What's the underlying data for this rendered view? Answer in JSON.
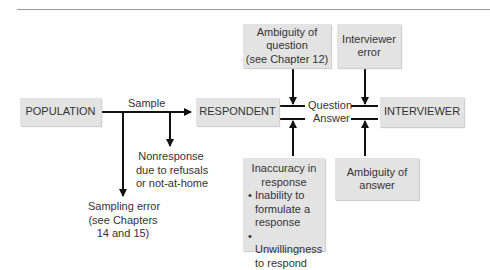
{
  "diagram": {
    "nodes": {
      "population": "POPULATION",
      "respondent": "RESPONDENT",
      "interviewer": "INTERVIEWER",
      "ambiguity_question": [
        "Ambiguity of",
        "question",
        "(see Chapter 12)"
      ],
      "interviewer_error": [
        "Interviewer",
        "error"
      ],
      "ambiguity_answer": [
        "Ambiguity of",
        "answer"
      ],
      "inaccuracy": {
        "title": [
          "Inaccuracy in",
          "response"
        ],
        "bullets": [
          "Inability to formulate a response",
          "Unwillingness to respond"
        ]
      }
    },
    "edge_labels": {
      "sample": "Sample",
      "question": "Question",
      "answer": "Answer"
    },
    "annotations": {
      "nonresponse": [
        "Nonresponse",
        "due to refusals",
        "or not-at-home"
      ],
      "sampling_error": [
        "Sampling error",
        "(see Chapters",
        "14 and 15)"
      ]
    },
    "bullet_char": "•"
  }
}
